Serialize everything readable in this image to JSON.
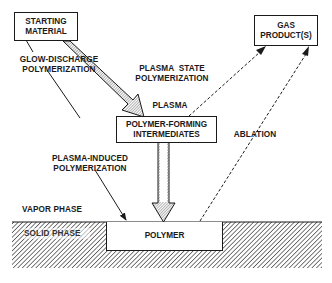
{
  "diagram": {
    "nodes": {
      "starting_material": {
        "line1": "STARTING",
        "line2": "MATERIAL"
      },
      "gas_products": {
        "line1": "GAS",
        "line2": "PRODUCT(S)"
      },
      "intermediates": {
        "line1": "POLYMER-FORMING",
        "line2": "INTERMEDIATES"
      },
      "polymer": {
        "label": "POLYMER"
      }
    },
    "labels": {
      "glow_discharge": {
        "line1": "GLOW-DISCHARGE",
        "line2": "POLYMERIZATION"
      },
      "plasma_state": {
        "line1": "PLASMA  STATE",
        "line2": "POLYMERIZATION"
      },
      "plasma": "PLASMA",
      "plasma_induced": {
        "line1": "PLASMA-INDUCED",
        "line2": "POLYMERIZATION"
      },
      "ablation": "ABLATION",
      "vapor_phase": "VAPOR PHASE",
      "solid_phase": "SOLID PHASE"
    },
    "edges": [
      {
        "from": "starting_material",
        "to": "intermediates",
        "style": "wide-hatched-arrow"
      },
      {
        "from": "starting_material",
        "to": "polymer",
        "style": "thin-solid-arrow"
      },
      {
        "from": "intermediates",
        "to": "gas_products",
        "style": "dashed-arrow"
      },
      {
        "from": "intermediates",
        "to": "polymer",
        "style": "wide-hatched-arrow"
      },
      {
        "from": "polymer",
        "to": "gas_products",
        "style": "dashed-arrow"
      }
    ],
    "colors": {
      "ink": "#1a1a1a",
      "hatch_fill": "#8a8a8a",
      "background": "#ffffff"
    }
  }
}
